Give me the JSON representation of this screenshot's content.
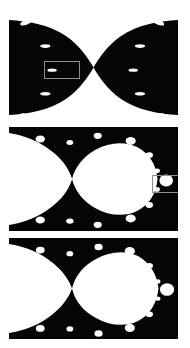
{
  "figure": {
    "background_color": "#ffffff",
    "set_color": "#ffffff",
    "exterior_color": "#050505",
    "roi_color": "#8e8e8e",
    "width": 190,
    "height": 348,
    "caption": ""
  },
  "panels": [
    {
      "id": "panel-top",
      "label": "",
      "x": 9,
      "y": 14,
      "width": 169,
      "height": 107,
      "zoom_level": "4x",
      "view": {
        "re_min": -0.78,
        "re_max": -0.7,
        "im_min": -0.025,
        "im_max": 0.025
      },
      "roi": {
        "x": 44,
        "y": 61,
        "width": 36,
        "height": 18
      },
      "bulbs": [
        {
          "cx": 0.1,
          "cy": 0.08,
          "rx": 0.035,
          "ry": 0.022,
          "rot": -18
        },
        {
          "cx": 0.885,
          "cy": 0.08,
          "rx": 0.035,
          "ry": 0.022,
          "rot": 18
        },
        {
          "cx": 0.215,
          "cy": 0.3,
          "rx": 0.03,
          "ry": 0.017,
          "rot": 0
        },
        {
          "cx": 0.775,
          "cy": 0.3,
          "rx": 0.03,
          "ry": 0.017,
          "rot": 0
        },
        {
          "cx": 0.255,
          "cy": 0.525,
          "rx": 0.028,
          "ry": 0.015,
          "rot": 0
        },
        {
          "cx": 0.735,
          "cy": 0.525,
          "rx": 0.028,
          "ry": 0.015,
          "rot": 0
        },
        {
          "cx": 0.215,
          "cy": 0.745,
          "rx": 0.03,
          "ry": 0.017,
          "rot": 0
        },
        {
          "cx": 0.775,
          "cy": 0.745,
          "rx": 0.03,
          "ry": 0.017,
          "rot": 0
        },
        {
          "cx": 0.1,
          "cy": 0.955,
          "rx": 0.035,
          "ry": 0.022,
          "rot": 18
        },
        {
          "cx": 0.885,
          "cy": 0.955,
          "rx": 0.035,
          "ry": 0.022,
          "rot": -18
        }
      ]
    },
    {
      "id": "panel-middle",
      "label": "",
      "x": 9,
      "y": 127,
      "width": 169,
      "height": 104,
      "zoom_level": "16x",
      "view": {
        "re_min": -0.7475,
        "re_max": -0.7395,
        "im_min": -0.0026,
        "im_max": 0.0026
      },
      "roi": {
        "x": 152,
        "y": 175,
        "width": 36,
        "height": 18
      },
      "bulbs": [
        {
          "cx": 0.185,
          "cy": 0.115,
          "rx": 0.028,
          "ry": 0.034,
          "rot": 0
        },
        {
          "cx": 0.525,
          "cy": 0.085,
          "rx": 0.024,
          "ry": 0.03,
          "rot": 0
        },
        {
          "cx": 0.72,
          "cy": 0.135,
          "rx": 0.03,
          "ry": 0.038,
          "rot": 0
        },
        {
          "cx": 0.83,
          "cy": 0.27,
          "rx": 0.022,
          "ry": 0.028,
          "rot": 0
        },
        {
          "cx": 0.875,
          "cy": 0.42,
          "rx": 0.018,
          "ry": 0.022,
          "rot": 0
        },
        {
          "cx": 0.875,
          "cy": 0.6,
          "rx": 0.018,
          "ry": 0.022,
          "rot": 0
        },
        {
          "cx": 0.83,
          "cy": 0.75,
          "rx": 0.022,
          "ry": 0.028,
          "rot": 0
        },
        {
          "cx": 0.72,
          "cy": 0.88,
          "rx": 0.03,
          "ry": 0.038,
          "rot": 0
        },
        {
          "cx": 0.525,
          "cy": 0.94,
          "rx": 0.024,
          "ry": 0.03,
          "rot": 0
        },
        {
          "cx": 0.36,
          "cy": 0.905,
          "rx": 0.022,
          "ry": 0.026,
          "rot": 0
        },
        {
          "cx": 0.185,
          "cy": 0.895,
          "rx": 0.028,
          "ry": 0.034,
          "rot": 0
        },
        {
          "cx": 0.36,
          "cy": 0.15,
          "rx": 0.02,
          "ry": 0.024,
          "rot": 0
        },
        {
          "cx": 0.93,
          "cy": 0.515,
          "rx": 0.04,
          "ry": 0.058,
          "rot": 0
        }
      ]
    },
    {
      "id": "panel-bottom",
      "label": "",
      "x": 9,
      "y": 238,
      "width": 169,
      "height": 101,
      "zoom_level": "64x",
      "view": {
        "re_min": -0.74375,
        "re_max": -0.74175,
        "im_min": -0.00065,
        "im_max": 0.00065
      },
      "roi": null,
      "bulbs": [
        {
          "cx": 0.185,
          "cy": 0.12,
          "rx": 0.026,
          "ry": 0.034,
          "rot": 0
        },
        {
          "cx": 0.36,
          "cy": 0.155,
          "rx": 0.02,
          "ry": 0.026,
          "rot": 0
        },
        {
          "cx": 0.53,
          "cy": 0.09,
          "rx": 0.024,
          "ry": 0.032,
          "rot": 0
        },
        {
          "cx": 0.715,
          "cy": 0.13,
          "rx": 0.03,
          "ry": 0.04,
          "rot": 0
        },
        {
          "cx": 0.83,
          "cy": 0.275,
          "rx": 0.022,
          "ry": 0.028,
          "rot": 0
        },
        {
          "cx": 0.88,
          "cy": 0.43,
          "rx": 0.016,
          "ry": 0.022,
          "rot": 0
        },
        {
          "cx": 0.88,
          "cy": 0.6,
          "rx": 0.016,
          "ry": 0.022,
          "rot": 0
        },
        {
          "cx": 0.83,
          "cy": 0.755,
          "rx": 0.022,
          "ry": 0.028,
          "rot": 0
        },
        {
          "cx": 0.715,
          "cy": 0.89,
          "rx": 0.03,
          "ry": 0.04,
          "rot": 0
        },
        {
          "cx": 0.53,
          "cy": 0.945,
          "rx": 0.024,
          "ry": 0.032,
          "rot": 0
        },
        {
          "cx": 0.36,
          "cy": 0.9,
          "rx": 0.02,
          "ry": 0.026,
          "rot": 0
        },
        {
          "cx": 0.185,
          "cy": 0.895,
          "rx": 0.026,
          "ry": 0.034,
          "rot": 0
        },
        {
          "cx": 0.935,
          "cy": 0.51,
          "rx": 0.042,
          "ry": 0.062,
          "rot": 0
        }
      ]
    }
  ],
  "chart_data": {
    "type": "heatmap",
    "subtitle": "",
    "xlabel": "Re(c)",
    "ylabel": "Im(c)",
    "legend": [],
    "grid": false,
    "panel_count": 3,
    "colormap": [
      "#050505",
      "#ffffff"
    ],
    "series": [
      {
        "name": "panel-top",
        "zoom": "4x",
        "xlim": [
          -0.78,
          -0.7
        ],
        "ylim": [
          -0.025,
          0.025
        ],
        "roi_next": [
          -0.7475,
          -0.7395,
          -0.0026,
          0.0026
        ]
      },
      {
        "name": "panel-middle",
        "zoom": "16x",
        "xlim": [
          -0.7475,
          -0.7395
        ],
        "ylim": [
          -0.0026,
          0.0026
        ],
        "roi_next": [
          -0.74375,
          -0.74175,
          -0.00065,
          0.00065
        ]
      },
      {
        "name": "panel-bottom",
        "zoom": "64x",
        "xlim": [
          -0.74375,
          -0.74175
        ],
        "ylim": [
          -0.00065,
          0.00065
        ],
        "roi_next": null
      }
    ]
  }
}
